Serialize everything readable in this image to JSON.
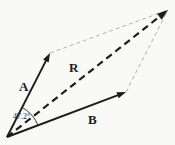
{
  "labels": {
    "vector_a": "A",
    "vector_b": "B",
    "resultant": "R",
    "angle": "47.2°"
  },
  "colors": {
    "background": "#f9f9f8",
    "line": "#1c1c1c",
    "guide": "#a8a8a8"
  },
  "geometry": {
    "origin": [
      7,
      137
    ],
    "a_tip": [
      50,
      53
    ],
    "b_tip": [
      126,
      92
    ],
    "r_tip": [
      168,
      10
    ],
    "arc": {
      "center": [
        7,
        137
      ],
      "radius": 33,
      "start_deg": 63,
      "end_deg": 21
    }
  }
}
